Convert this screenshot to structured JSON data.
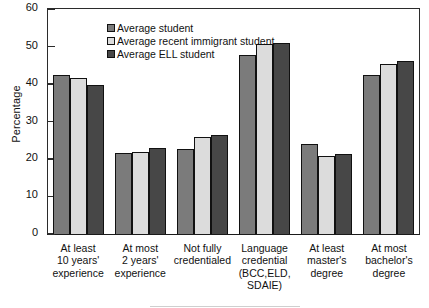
{
  "chart_data": {
    "type": "bar",
    "title": "",
    "xlabel": "",
    "ylabel": "Percentage",
    "ylim": [
      0,
      60
    ],
    "yticks": [
      0,
      10,
      20,
      30,
      40,
      50,
      60
    ],
    "grid": false,
    "legend_position": "top-left",
    "categories": [
      "At least\n10 years'\nexperience",
      "At most\n2 years'\nexperience",
      "Not fully\ncredentialed",
      "Language\ncredential\n(BCC,ELD,\nSDAIE)",
      "At least\nmaster's\ndegree",
      "At most\nbachelor's\ndegree"
    ],
    "category_lines": [
      [
        "At least",
        "10 years'",
        "experience"
      ],
      [
        "At most",
        "2 years'",
        "experience"
      ],
      [
        "Not fully",
        "credentialed"
      ],
      [
        "Language",
        "credential",
        "(BCC,ELD,",
        "SDAIE)"
      ],
      [
        "At least",
        "master's",
        "degree"
      ],
      [
        "At most",
        "bachelor's",
        "degree"
      ]
    ],
    "series": [
      {
        "name": "Average student",
        "color": "#7b7b7b",
        "values": [
          42.5,
          21.5,
          22.8,
          47.8,
          24.0,
          42.3
        ]
      },
      {
        "name": "Average recent immigrant student",
        "color": "#dcdcdc",
        "values": [
          41.5,
          22.0,
          26.0,
          50.8,
          20.8,
          45.3
        ]
      },
      {
        "name": "Average ELL student",
        "color": "#474747",
        "values": [
          39.7,
          23.0,
          26.5,
          51.0,
          21.3,
          46.2
        ]
      }
    ]
  },
  "axis": {
    "ylabel": "Percentage",
    "tick_0": "0",
    "tick_10": "10",
    "tick_20": "20",
    "tick_30": "30",
    "tick_40": "40",
    "tick_50": "50",
    "tick_60": "60"
  },
  "legend": {
    "items": [
      {
        "label": "Average student"
      },
      {
        "label": "Average recent immigrant student"
      },
      {
        "label": "Average ELL student"
      }
    ]
  }
}
